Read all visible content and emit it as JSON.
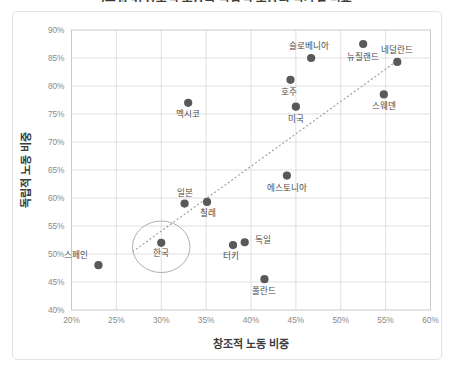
{
  "chart_title": "[그림 4] 창조적 노동과 독립적 노동의 국가별 비교",
  "axes": {
    "x_title": "창조적 노동 비중",
    "y_title": "독립적 노동 비중",
    "x_ticks": [
      "20%",
      "25%",
      "30%",
      "35%",
      "40%",
      "45%",
      "50%",
      "55%",
      "60%"
    ],
    "y_ticks": [
      "40%",
      "45%",
      "50%",
      "55%",
      "60%",
      "65%",
      "70%",
      "75%",
      "80%",
      "85%",
      "90%"
    ]
  },
  "colors": {
    "marker": "#595959",
    "gridline": "#d8d8d8",
    "frame": "#c4c4c4",
    "trendline": "#9a9a9a",
    "highlight": "#b0b0b0",
    "tick_text": "#8a8a8a",
    "axis_title_text": "#3c3c3c",
    "label_text": "#4a4a4a",
    "background": "#ffffff"
  },
  "chart_data": {
    "type": "scatter",
    "title": "[그림 4] 창조적 노동과 독립적 노동의 국가별 비교",
    "xlabel": "창조적 노동 비중",
    "ylabel": "독립적 노동 비중",
    "xlim": [
      20,
      60
    ],
    "ylim": [
      40,
      90
    ],
    "x_tick_step": 5,
    "y_tick_step": 5,
    "grid": true,
    "legend": "none",
    "points": [
      {
        "name": "스페인",
        "x": 23.0,
        "y": 48.0,
        "label_dx": -22,
        "label_dy": -7
      },
      {
        "name": "한국",
        "x": 30.0,
        "y": 52.0,
        "label_dx": 0,
        "label_dy": 13,
        "highlighted": true
      },
      {
        "name": "일본",
        "x": 32.6,
        "y": 59.0,
        "label_dx": 0,
        "label_dy": -8
      },
      {
        "name": "칠레",
        "x": 35.1,
        "y": 59.3,
        "label_dx": 1,
        "label_dy": 14
      },
      {
        "name": "멕시코",
        "x": 33.0,
        "y": 77.0,
        "label_dx": 0,
        "label_dy": 14
      },
      {
        "name": "터키",
        "x": 38.0,
        "y": 51.6,
        "label_dx": -2,
        "label_dy": 14
      },
      {
        "name": "독일",
        "x": 39.3,
        "y": 52.1,
        "label_dx": 18,
        "label_dy": 1
      },
      {
        "name": "폴란드",
        "x": 41.5,
        "y": 45.5,
        "label_dx": 0,
        "label_dy": 15
      },
      {
        "name": "에스토니아",
        "x": 44.0,
        "y": 64.0,
        "label_dx": 0,
        "label_dy": 15
      },
      {
        "name": "미국",
        "x": 45.0,
        "y": 76.3,
        "label_dx": 0,
        "label_dy": 15
      },
      {
        "name": "호주",
        "x": 44.4,
        "y": 81.1,
        "label_dx": -1,
        "label_dy": 15
      },
      {
        "name": "슬로베니아",
        "x": 46.7,
        "y": 85.0,
        "label_dx": -2,
        "label_dy": -9
      },
      {
        "name": "뉴질랜드",
        "x": 52.5,
        "y": 87.5,
        "label_dx": 0,
        "label_dy": 16
      },
      {
        "name": "네덜란드",
        "x": 56.3,
        "y": 84.3,
        "label_dx": 0,
        "label_dy": -9
      },
      {
        "name": "스웨덴",
        "x": 54.8,
        "y": 78.5,
        "label_dx": 0,
        "label_dy": 15
      }
    ],
    "trendline": {
      "x0": 26.8,
      "y0": 50.4,
      "x1": 56.2,
      "y1": 84.4,
      "style": "dotted"
    },
    "highlight_annotation": {
      "target": "한국",
      "shape": "ellipse",
      "rx_units": 3.2,
      "ry_units": 4.6
    }
  }
}
